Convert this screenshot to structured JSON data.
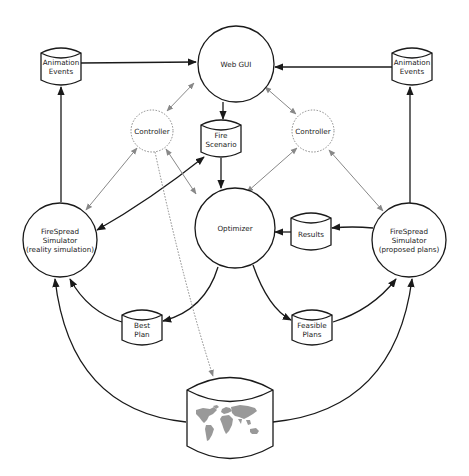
{
  "diagram": {
    "type": "architecture-flow",
    "nodes": [
      {
        "id": "web_gui",
        "shape": "circle",
        "label": "Web GUI"
      },
      {
        "id": "anim_left",
        "shape": "cylinder",
        "label_line1": "Animation",
        "label_line2": "Events"
      },
      {
        "id": "anim_right",
        "shape": "cylinder",
        "label_line1": "Animation",
        "label_line2": "Events"
      },
      {
        "id": "controller_left",
        "shape": "dotted-circle",
        "label": "Controller"
      },
      {
        "id": "controller_right",
        "shape": "dotted-circle",
        "label": "Controller"
      },
      {
        "id": "fire_scenario",
        "shape": "cylinder",
        "label_line1": "Fire",
        "label_line2": "Scenario"
      },
      {
        "id": "optimizer",
        "shape": "circle",
        "label": "Optimizer"
      },
      {
        "id": "sim_left",
        "shape": "circle",
        "label_line1": "FireSpread",
        "label_line2": "Simulator",
        "label_line3": "(reality simulation)"
      },
      {
        "id": "sim_right",
        "shape": "circle",
        "label_line1": "FireSpread",
        "label_line2": "Simulator",
        "label_line3": "(proposed plans)"
      },
      {
        "id": "results",
        "shape": "cylinder",
        "label": "Results"
      },
      {
        "id": "best_plan",
        "shape": "cylinder",
        "label_line1": "Best",
        "label_line2": "Plan"
      },
      {
        "id": "feasible_plans",
        "shape": "cylinder",
        "label_line1": "Feasible",
        "label_line2": "Plans"
      },
      {
        "id": "map_db",
        "shape": "cylinder-with-world-map",
        "label": ""
      }
    ],
    "edges": [
      {
        "from": "anim_left",
        "to": "web_gui",
        "style": "solid"
      },
      {
        "from": "anim_right",
        "to": "web_gui",
        "style": "solid"
      },
      {
        "from": "sim_left",
        "to": "anim_left",
        "style": "solid"
      },
      {
        "from": "sim_right",
        "to": "anim_right",
        "style": "solid"
      },
      {
        "from": "web_gui",
        "to": "fire_scenario",
        "style": "solid"
      },
      {
        "from": "fire_scenario",
        "to": "optimizer",
        "style": "solid"
      },
      {
        "from": "fire_scenario",
        "to": "sim_left",
        "style": "solid",
        "bidirectional": true
      },
      {
        "from": "web_gui",
        "to": "controller_left",
        "style": "gray",
        "bidirectional": true
      },
      {
        "from": "web_gui",
        "to": "controller_right",
        "style": "gray",
        "bidirectional": true
      },
      {
        "from": "controller_left",
        "to": "sim_left",
        "style": "gray",
        "bidirectional": true
      },
      {
        "from": "controller_left",
        "to": "optimizer",
        "style": "gray",
        "bidirectional": true
      },
      {
        "from": "controller_right",
        "to": "optimizer",
        "style": "gray",
        "bidirectional": true
      },
      {
        "from": "controller_right",
        "to": "sim_right",
        "style": "gray",
        "bidirectional": true
      },
      {
        "from": "controller_left",
        "to": "map_db",
        "style": "dotted"
      },
      {
        "from": "sim_right",
        "to": "results",
        "style": "solid"
      },
      {
        "from": "results",
        "to": "optimizer",
        "style": "solid"
      },
      {
        "from": "optimizer",
        "to": "best_plan",
        "style": "solid"
      },
      {
        "from": "optimizer",
        "to": "feasible_plans",
        "style": "solid"
      },
      {
        "from": "best_plan",
        "to": "sim_left",
        "style": "solid"
      },
      {
        "from": "feasible_plans",
        "to": "sim_right",
        "style": "solid"
      },
      {
        "from": "map_db",
        "to": "sim_left",
        "style": "solid"
      },
      {
        "from": "map_db",
        "to": "sim_right",
        "style": "solid"
      }
    ]
  },
  "colors": {
    "stroke": "#1a1a1a",
    "gray_stroke": "#888888",
    "map_fill": "#999999",
    "background": "#ffffff"
  }
}
